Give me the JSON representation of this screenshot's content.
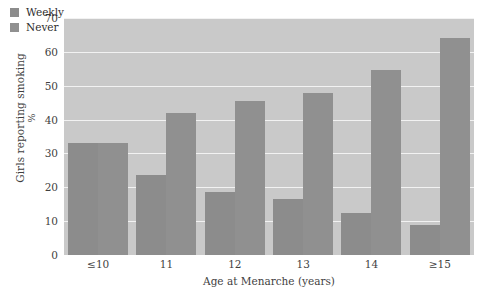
{
  "chart_data": {
    "type": "bar",
    "title": "",
    "subtitle": "",
    "xlabel": "Age at Menarche (years)",
    "ylabel_line1": "Girls reporting smoking",
    "ylabel_line2": "%",
    "categories": [
      "≤10",
      "11",
      "12",
      "13",
      "14",
      "≥15"
    ],
    "series": [
      {
        "name": "Weekly",
        "color": "#8c8c8c",
        "values": [
          33,
          23.5,
          18.5,
          16.5,
          12.5,
          9
        ]
      },
      {
        "name": "Never",
        "color": "#909090",
        "values": [
          33,
          42,
          45.5,
          48,
          54.5,
          64
        ]
      }
    ],
    "ylim": [
      0,
      70
    ],
    "ytick_values": [
      0,
      10,
      20,
      30,
      40,
      50,
      60,
      70
    ],
    "ytick_labels": [
      "0",
      "10",
      "20",
      "30",
      "40",
      "50",
      "60",
      "70"
    ],
    "grid": true,
    "grid_axis": "y",
    "grid_color": "#f2f2f2",
    "plot_background": "#c9c9c9",
    "figure_background": "#ffffff",
    "legend_position": "top-left"
  }
}
